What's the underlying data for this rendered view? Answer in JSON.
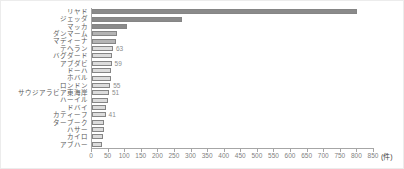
{
  "chart_data": {
    "type": "bar",
    "orientation": "horizontal",
    "title": "",
    "xlabel": "",
    "ylabel": "",
    "unit_label": "(件)",
    "xlim": [
      0,
      850
    ],
    "tick_step": 50,
    "x_tick_labels": [
      "0",
      "50",
      "100",
      "150",
      "200",
      "250",
      "300",
      "350",
      "400",
      "450",
      "500",
      "550",
      "600",
      "650",
      "700",
      "750",
      "800",
      "850"
    ],
    "categories": [
      "リヤド",
      "ジェッダ",
      "マッカ",
      "ダンマーム",
      "マディーナ",
      "テヘラン",
      "バグダード",
      "アブダビ",
      "ドーハ",
      "ホバル",
      "ロンドン",
      "サウジアラビア東海岸",
      "ハーイル",
      "ドバイ",
      "カティーフ",
      "ターブーク",
      "ハサー",
      "カイロ",
      "アブハー"
    ],
    "values": [
      800,
      270,
      107,
      76,
      73,
      63,
      61,
      59,
      58,
      56,
      55,
      51,
      47,
      43,
      41,
      37,
      35,
      33,
      31
    ],
    "data_labels": [
      "",
      "",
      "",
      "",
      "",
      "63",
      "",
      "59",
      "",
      "",
      "55",
      "51",
      "",
      "",
      "41",
      "",
      "",
      "",
      ""
    ],
    "bar_fills": [
      "#8a8a8a",
      "#8a8a8a",
      "#8a8a8a",
      "#b4b4b4",
      "#b4b4b4",
      "#dcdcdc",
      "#dcdcdc",
      "#dcdcdc",
      "#dcdcdc",
      "#dcdcdc",
      "#dcdcdc",
      "#dcdcdc",
      "#dcdcdc",
      "#dcdcdc",
      "#dcdcdc",
      "#dcdcdc",
      "#dcdcdc",
      "#dcdcdc",
      "#dcdcdc"
    ],
    "bar_border_color": "#858585",
    "axis_color": "#a6a6a6",
    "tick_label_color": "#7f7f7f",
    "category_label_color": "#595959",
    "grid": false,
    "legend": null
  }
}
